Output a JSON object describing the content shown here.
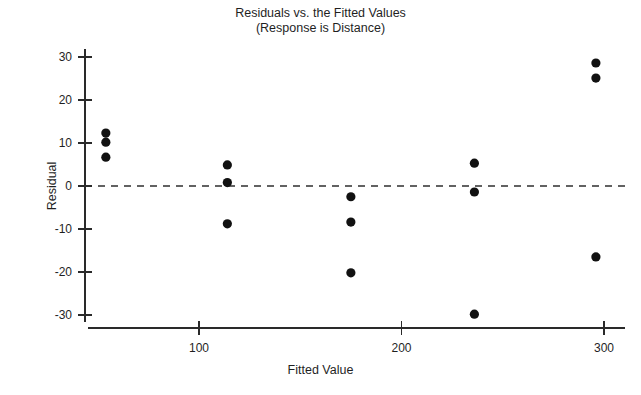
{
  "chart_data": {
    "type": "scatter",
    "title": "Residuals vs. the Fitted Values",
    "subtitle": "(Response is Distance)",
    "xlabel": "Fitted Value",
    "ylabel": "Residual",
    "xlim": [
      41,
      311
    ],
    "ylim": [
      -34,
      33
    ],
    "xticks": [
      100,
      200,
      300
    ],
    "xtick_labels": [
      "100",
      "200",
      "300"
    ],
    "yticks": [
      30,
      20,
      10,
      0,
      -10,
      -20,
      -30
    ],
    "ytick_labels": [
      "30",
      "20",
      "10",
      "0",
      "-10",
      "-20",
      "-30"
    ],
    "grid": false,
    "legend": false,
    "reference_line": {
      "orientation": "horizontal",
      "value": 0,
      "style": "dashed",
      "color": "#2f2f2f"
    },
    "marker": {
      "shape": "circle",
      "color": "#111111",
      "size": 4.6
    },
    "x": [
      54,
      54,
      54,
      114,
      114,
      114,
      175,
      175,
      175,
      236,
      236,
      236,
      296,
      296,
      296
    ],
    "y": [
      12.3,
      10.2,
      6.7,
      4.9,
      0.8,
      -8.8,
      -2.5,
      -8.4,
      -20.2,
      5.3,
      -1.4,
      -29.8,
      28.6,
      25.1,
      -16.5
    ],
    "points": [
      {
        "x": 54,
        "y": 12.3
      },
      {
        "x": 54,
        "y": 10.2
      },
      {
        "x": 54,
        "y": 6.7
      },
      {
        "x": 114,
        "y": 4.9
      },
      {
        "x": 114,
        "y": 0.8
      },
      {
        "x": 114,
        "y": -8.8
      },
      {
        "x": 175,
        "y": -2.5
      },
      {
        "x": 175,
        "y": -8.4
      },
      {
        "x": 175,
        "y": -20.2
      },
      {
        "x": 236,
        "y": 5.3
      },
      {
        "x": 236,
        "y": -1.4
      },
      {
        "x": 236,
        "y": -29.8
      },
      {
        "x": 296,
        "y": 28.6
      },
      {
        "x": 296,
        "y": 25.1
      },
      {
        "x": 296,
        "y": -16.5
      }
    ]
  },
  "artifact": {
    "text": ""
  }
}
